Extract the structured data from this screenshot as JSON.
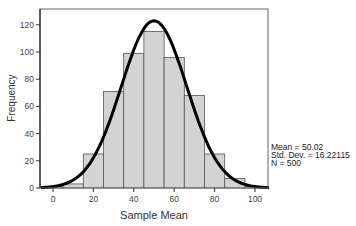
{
  "chart_data": {
    "type": "bar",
    "subtype": "histogram_with_normal_curve",
    "title": "",
    "xlabel": "Sample Mean",
    "ylabel": "Frequency",
    "xlim": [
      -6,
      107
    ],
    "ylim": [
      0,
      131
    ],
    "xticks": [
      0,
      20,
      40,
      60,
      80,
      100
    ],
    "yticks": [
      0,
      20,
      40,
      60,
      80,
      100,
      120
    ],
    "bin_width": 10,
    "categories": [
      0,
      10,
      20,
      30,
      40,
      50,
      60,
      70,
      80,
      90,
      100
    ],
    "values": [
      1,
      3,
      25,
      71,
      99,
      115,
      96,
      68,
      25,
      7,
      1
    ],
    "normal_curve": {
      "mean": 50.02,
      "std": 16.22115,
      "n": 500,
      "peak": 123
    },
    "grid": false,
    "bar_color": "#d3d3d3",
    "bar_edge_color": "#555555",
    "curve_color": "#000000"
  },
  "stats": {
    "mean": "Mean = 50.02",
    "std": "Std. Dev. = 16.22115",
    "n": "N = 500"
  }
}
